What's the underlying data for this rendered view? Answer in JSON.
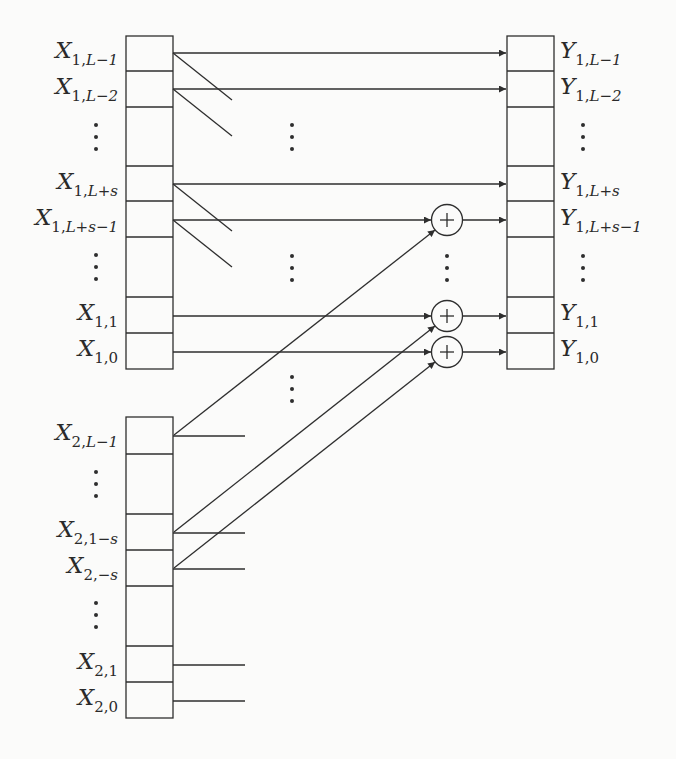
{
  "diagram": {
    "type": "register-shift-add-network",
    "line_color": "#2e2e2e",
    "background": "#fbfbfa",
    "input_register_1": {
      "labels": [
        {
          "base": "X",
          "sub1": "1,",
          "sub2": "L−1"
        },
        {
          "base": "X",
          "sub1": "1,",
          "sub2": "L−2"
        },
        {
          "ellipsis": true
        },
        {
          "base": "X",
          "sub1": "1,",
          "sub2": "L+s"
        },
        {
          "base": "X",
          "sub1": "1,",
          "sub2": "L+s−1"
        },
        {
          "ellipsis": true
        },
        {
          "base": "X",
          "sub1": "1,1",
          "sub2": ""
        },
        {
          "base": "X",
          "sub1": "1,0",
          "sub2": ""
        }
      ]
    },
    "input_register_2": {
      "labels": [
        {
          "base": "X",
          "sub1": "2,",
          "sub2": "L−1"
        },
        {
          "ellipsis": true
        },
        {
          "base": "X",
          "sub1": "2,1−",
          "sub2": "s"
        },
        {
          "base": "X",
          "sub1": "2,−",
          "sub2": "s"
        },
        {
          "ellipsis": true
        },
        {
          "base": "X",
          "sub1": "2,1",
          "sub2": ""
        },
        {
          "base": "X",
          "sub1": "2,0",
          "sub2": ""
        }
      ]
    },
    "output_register": {
      "labels": [
        {
          "base": "Y",
          "sub1": "1,",
          "sub2": "L−1"
        },
        {
          "base": "Y",
          "sub1": "1,",
          "sub2": "L−2"
        },
        {
          "ellipsis": true
        },
        {
          "base": "Y",
          "sub1": "1,",
          "sub2": "L+s"
        },
        {
          "base": "Y",
          "sub1": "1,",
          "sub2": "L+s−1"
        },
        {
          "ellipsis": true
        },
        {
          "base": "Y",
          "sub1": "1,1",
          "sub2": ""
        },
        {
          "base": "Y",
          "sub1": "1,0",
          "sub2": ""
        }
      ]
    },
    "adders": [
      {
        "symbol": "+",
        "feeds": "Y_{1,L+s-1}",
        "inputs": [
          "X_{1,L+s-1}",
          "X_{2,L-1}"
        ]
      },
      {
        "symbol": "+",
        "feeds": "Y_{1,1}",
        "inputs": [
          "X_{1,1}",
          "X_{2,1-s}"
        ]
      },
      {
        "symbol": "+",
        "feeds": "Y_{1,0}",
        "inputs": [
          "X_{1,0}",
          "X_{2,-s}"
        ]
      }
    ]
  },
  "text": {
    "x1_0_base": "X",
    "x1_0_s1": "1,",
    "x1_0_s2": "L−1",
    "x1_1_base": "X",
    "x1_1_s1": "1,",
    "x1_1_s2": "L−2",
    "x1_3_base": "X",
    "x1_3_s1": "1,",
    "x1_3_s2": "L+s",
    "x1_4_base": "X",
    "x1_4_s1": "1,",
    "x1_4_s2": "L+s−1",
    "x1_6_base": "X",
    "x1_6_s1": "1,1",
    "x1_7_base": "X",
    "x1_7_s1": "1,0",
    "x2_0_base": "X",
    "x2_0_s1": "2,",
    "x2_0_s2": "L−1",
    "x2_2_base": "X",
    "x2_2_s1": "2,1−",
    "x2_2_s2": "s",
    "x2_3_base": "X",
    "x2_3_s1": "2,−",
    "x2_3_s2": "s",
    "x2_5_base": "X",
    "x2_5_s1": "2,1",
    "x2_6_base": "X",
    "x2_6_s1": "2,0",
    "y_0_base": "Y",
    "y_0_s1": "1,",
    "y_0_s2": "L−1",
    "y_1_base": "Y",
    "y_1_s1": "1,",
    "y_1_s2": "L−2",
    "y_3_base": "Y",
    "y_3_s1": "1,",
    "y_3_s2": "L+s",
    "y_4_base": "Y",
    "y_4_s1": "1,",
    "y_4_s2": "L+s−1",
    "y_6_base": "Y",
    "y_6_s1": "1,1",
    "y_7_base": "Y",
    "y_7_s1": "1,0",
    "adder_symbol": "+"
  }
}
